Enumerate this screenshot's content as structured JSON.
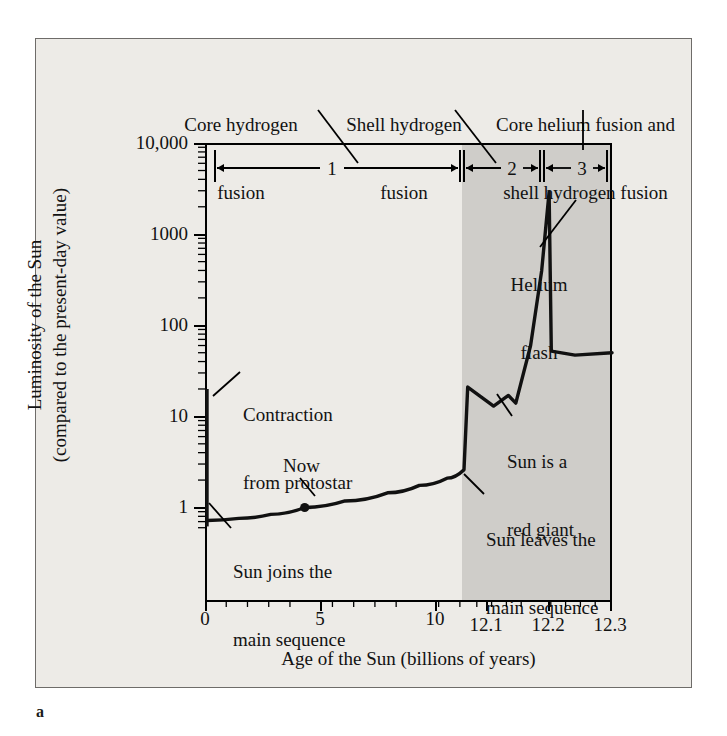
{
  "figure": {
    "panel_label": "a"
  },
  "axes": {
    "ylabel_line1": "Luminosity of the Sun",
    "ylabel_line2": "(compared to the present-day value)",
    "xlabel": "Age of the Sun (billions of years)",
    "y_ticks": [
      "1",
      "10",
      "100",
      "1000",
      "10,000"
    ],
    "x_ticks": [
      "0",
      "5",
      "10",
      "12.1",
      "12.2",
      "12.3"
    ]
  },
  "phases": [
    {
      "number": "1",
      "label_line1": "Core hydrogen",
      "label_line2": "fusion"
    },
    {
      "number": "2",
      "label_line1": "Shell hydrogen",
      "label_line2": "fusion"
    },
    {
      "number": "3",
      "label_line1": "Core helium fusion and",
      "label_line2": "shell hydrogen fusion"
    }
  ],
  "annotations": {
    "contraction_line1": "Contraction",
    "contraction_line2": "from protostar",
    "now": "Now",
    "joins_line1": "Sun joins the",
    "joins_line2": "main sequence",
    "leaves_line1": "Sun leaves the",
    "leaves_line2": "main sequence",
    "redgiant_line1": "Sun is a",
    "redgiant_line2": "red giant",
    "helium_line1": "Helium",
    "helium_line2": "flash"
  },
  "colors": {
    "page_background": "#ffffff",
    "figure_background": "#edebe7",
    "shaded_region": "#cfcdc9",
    "curve": "#111111",
    "axis": "#000000"
  },
  "chart_data": {
    "type": "line",
    "xlabel": "Age of the Sun (billions of years)",
    "ylabel": "Luminosity of the Sun (compared to the present-day value)",
    "yscale": "log",
    "ylim": [
      0.55,
      10000
    ],
    "y_tick_values": [
      1,
      10,
      100,
      1000,
      10000
    ],
    "x_axis_note": "Broken/expanded scale: linear 0-12.1 Gyr compressed on the left, 12.1-12.3 Gyr expanded on the right",
    "x_tick_values": [
      0,
      5,
      10,
      12.1,
      12.2,
      12.3
    ],
    "grid": false,
    "legend": false,
    "shaded_region_x": [
      12.1,
      12.3
    ],
    "phase_spans": [
      {
        "number": 1,
        "name": "Core hydrogen fusion",
        "x_start": 0,
        "x_end": 12.1
      },
      {
        "number": 2,
        "name": "Shell hydrogen fusion",
        "x_start": 12.1,
        "x_end": 12.2
      },
      {
        "number": 3,
        "name": "Core helium fusion and shell hydrogen fusion",
        "x_start": 12.2,
        "x_end": 12.3
      }
    ],
    "series": [
      {
        "name": "Contraction from protostar",
        "points": [
          {
            "x": 0,
            "y": 20
          },
          {
            "x": 0,
            "y": 0.62
          }
        ]
      },
      {
        "name": "Luminosity of the Sun",
        "points": [
          {
            "x": 0,
            "y": 0.72
          },
          {
            "x": 1.5,
            "y": 0.76
          },
          {
            "x": 3.0,
            "y": 0.84
          },
          {
            "x": 4.6,
            "y": 1.0
          },
          {
            "x": 6.5,
            "y": 1.18
          },
          {
            "x": 8.5,
            "y": 1.45
          },
          {
            "x": 10.0,
            "y": 1.75
          },
          {
            "x": 11.3,
            "y": 2.1
          },
          {
            "x": 12.1,
            "y": 2.6
          },
          {
            "x": 12.105,
            "y": 21
          },
          {
            "x": 12.14,
            "y": 13
          },
          {
            "x": 12.16,
            "y": 17
          },
          {
            "x": 12.17,
            "y": 14
          },
          {
            "x": 12.19,
            "y": 60
          },
          {
            "x": 12.205,
            "y": 400
          },
          {
            "x": 12.215,
            "y": 2900
          },
          {
            "x": 12.218,
            "y": 52
          },
          {
            "x": 12.25,
            "y": 47
          },
          {
            "x": 12.3,
            "y": 50
          }
        ]
      }
    ],
    "markers": [
      {
        "label": "Now",
        "x": 4.6,
        "y": 1.0
      }
    ],
    "annotations": [
      {
        "text": "Contraction from protostar",
        "x": 0,
        "y": 12
      },
      {
        "text": "Sun joins the main sequence",
        "x": 0,
        "y": 0.72
      },
      {
        "text": "Now",
        "x": 4.6,
        "y": 1.0
      },
      {
        "text": "Sun leaves the main sequence",
        "x": 12.1,
        "y": 2.6
      },
      {
        "text": "Sun is a red giant",
        "x": 12.17,
        "y": 15
      },
      {
        "text": "Helium flash",
        "x": 12.215,
        "y": 2900
      }
    ]
  }
}
